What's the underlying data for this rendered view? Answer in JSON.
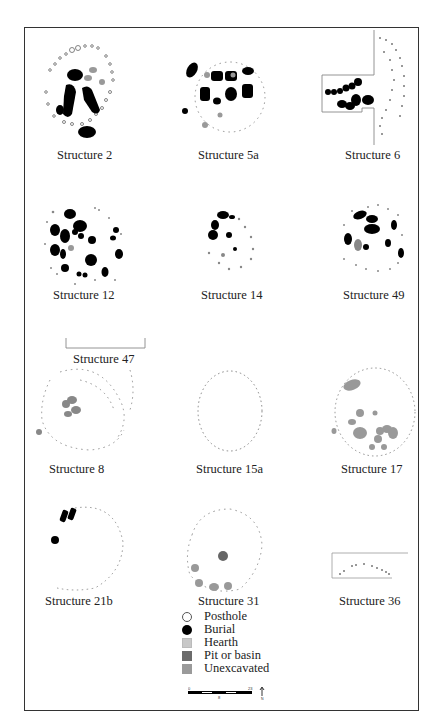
{
  "figure": {
    "structures": [
      {
        "id": "s2",
        "label": "Structure 2"
      },
      {
        "id": "s5a",
        "label": "Structure 5a"
      },
      {
        "id": "s6",
        "label": "Structure 6"
      },
      {
        "id": "s12",
        "label": "Structure 12"
      },
      {
        "id": "s14",
        "label": "Structure 14"
      },
      {
        "id": "s49",
        "label": "Structure 49"
      },
      {
        "id": "s47",
        "label": "Structure 47"
      },
      {
        "id": "s8",
        "label": "Structure 8"
      },
      {
        "id": "s15a",
        "label": "Structure 15a"
      },
      {
        "id": "s17",
        "label": "Structure 17"
      },
      {
        "id": "s21b",
        "label": "Structure 21b"
      },
      {
        "id": "s31",
        "label": "Structure 31"
      },
      {
        "id": "s36",
        "label": "Structure 36"
      }
    ],
    "legend": {
      "items": [
        {
          "key": "posthole",
          "label": "Posthole",
          "color": "#ffffff"
        },
        {
          "key": "burial",
          "label": "Burial",
          "color": "#000000"
        },
        {
          "key": "hearth",
          "label": "Hearth",
          "color": "#c8c8c8"
        },
        {
          "key": "pit",
          "label": "Pit or basin",
          "color": "#6b6b6b"
        },
        {
          "key": "unexcavated",
          "label": "Unexcavated",
          "color": "#9a9a9a"
        }
      ]
    },
    "scale": {
      "start": "0",
      "mid": "8",
      "end": "23",
      "north": "N"
    }
  }
}
